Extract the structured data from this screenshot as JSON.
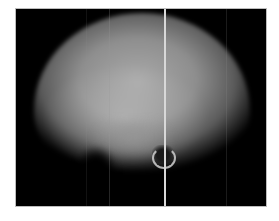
{
  "image": {
    "description": "Grayscale radiograph of a rounded skull-like specimen on black background with a bright vertical scan artifact line",
    "colors": {
      "page_background": "#ffffff",
      "frame_background": "#000000",
      "specimen_highlight": "#a9a9a9",
      "artifact_line": "#d8d8d8"
    }
  }
}
